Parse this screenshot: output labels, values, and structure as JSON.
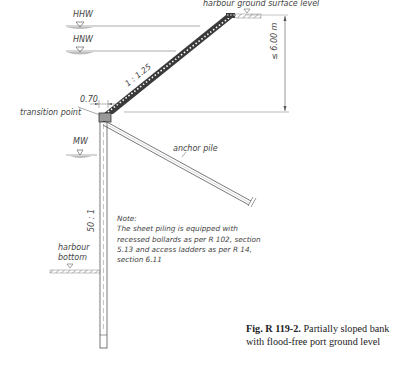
{
  "water_levels": {
    "hhw": "HHW",
    "hnw": "HNW",
    "mw": "MW"
  },
  "labels": {
    "harbour_ground": "harbour ground surface level",
    "height_dim": "≤ 6.00 m",
    "slope": "1 : 1.25",
    "width_dim": "0.70",
    "transition_point": "transition point",
    "anchor_pile": "anchor pile",
    "pile_rake": "50 : 1",
    "harbour_bottom_1": "harbour",
    "harbour_bottom_2": "bottom"
  },
  "note": {
    "title": "Note:",
    "line1": "The sheet piling is equipped with",
    "line2": "recessed bollards as per R 102, section",
    "line3": "5.13 and access ladders as per R 14,",
    "line4": "section 6.11"
  },
  "caption": {
    "fig": "Fig. R 119-2.",
    "line1": "Partially sloped bank",
    "line2": "with flood-free port ground level"
  },
  "colors": {
    "line": "#555555",
    "revetment": "#3a3a3a",
    "water_fill": "#bdbdbd",
    "text": "#444444"
  }
}
